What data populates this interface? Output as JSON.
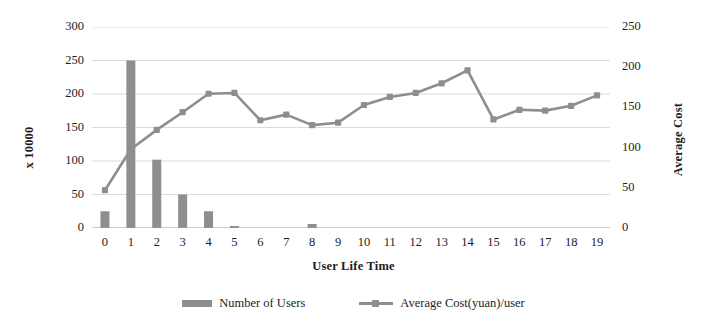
{
  "chart_data": {
    "type": "bar",
    "title": "",
    "xlabel": "User Life Time",
    "ylabel": "x 10000",
    "ylabel_secondary": "Average Cost",
    "categories": [
      "0",
      "1",
      "2",
      "3",
      "4",
      "5",
      "6",
      "7",
      "8",
      "9",
      "10",
      "11",
      "12",
      "13",
      "14",
      "15",
      "16",
      "17",
      "18",
      "19"
    ],
    "grid": true,
    "legend_position": "bottom",
    "axes": {
      "left": {
        "label": "x 10000",
        "ticks": [
          "0",
          "50",
          "100",
          "150",
          "200",
          "250",
          "300"
        ],
        "ylim": [
          0,
          300
        ],
        "tick_step": 50
      },
      "right": {
        "label": "Average Cost",
        "ticks": [
          "0",
          "50",
          "100",
          "150",
          "200",
          "250"
        ],
        "ylim": [
          0,
          250
        ],
        "tick_step": 50
      }
    },
    "series": [
      {
        "name": "Number of Users",
        "type": "bar",
        "axis": "left",
        "color": "#8e8e8e",
        "values": [
          25,
          250,
          102,
          50,
          25,
          3,
          0,
          0,
          6,
          0,
          0,
          0,
          0,
          0,
          0,
          0,
          0,
          0,
          0,
          0
        ]
      },
      {
        "name": "Average Cost(yuan)/user",
        "type": "line",
        "axis": "right",
        "color": "#8e8e8e",
        "values": [
          47,
          98,
          122,
          144,
          167,
          168,
          134,
          141,
          128,
          131,
          153,
          163,
          168,
          180,
          196,
          135,
          147,
          146,
          152,
          165
        ]
      }
    ]
  },
  "legend": {
    "items": [
      {
        "label": "Number of Users",
        "marker": "bar-swatch-icon"
      },
      {
        "label": "Average Cost(yuan)/user",
        "marker": "line-marker-icon"
      }
    ]
  }
}
